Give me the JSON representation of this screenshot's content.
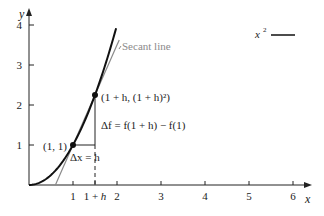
{
  "chart_data": {
    "type": "line",
    "title": "",
    "xlabel": "x",
    "ylabel": "y",
    "xlim": [
      0,
      6.4
    ],
    "ylim": [
      0,
      4.3
    ],
    "x_ticks": [
      1,
      2,
      3,
      4,
      5,
      6
    ],
    "x_tick_labels": [
      "1",
      "2",
      "3",
      "4",
      "5",
      "6"
    ],
    "extra_x_tick": {
      "value": 1.5,
      "label": "1 + h"
    },
    "y_ticks": [
      1,
      2,
      3,
      4
    ],
    "y_tick_labels": [
      "1",
      "2",
      "3",
      "4"
    ],
    "grid": false,
    "legend": {
      "placement": "top-right",
      "entries": [
        "x²"
      ]
    },
    "legend_parts": {
      "base": "x",
      "sup": "2"
    },
    "series": [
      {
        "name": "x^2",
        "function": "x^2",
        "x_range": [
          0,
          1.98
        ],
        "color": "#111111"
      }
    ],
    "secant": {
      "name": "Secant line",
      "x_range": [
        0.6,
        2.05
      ],
      "through": [
        [
          1,
          1
        ],
        [
          1.5,
          2.25
        ]
      ],
      "color": "#8a8a8a"
    },
    "points": [
      {
        "x": 1,
        "y": 1,
        "label": "(1, 1)"
      },
      {
        "x": 1.5,
        "y": 2.25,
        "label": "(1 + h, (1 + h)²)"
      }
    ],
    "h": 0.5,
    "annotations": {
      "secant_label": "Secant line",
      "delta_x": "Δx = h",
      "delta_f": "Δf = f(1 + h) − f(1)"
    }
  }
}
